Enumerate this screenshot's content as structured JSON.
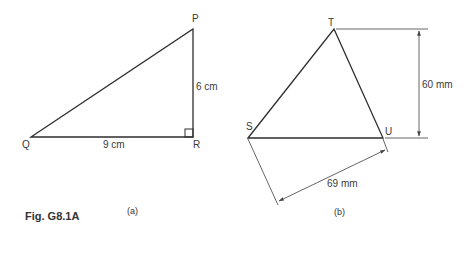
{
  "figure": {
    "caption": "Fig. G8.1A",
    "colors": {
      "line": "#333333",
      "dimension": "#555555",
      "background": "#ffffff"
    }
  },
  "diagram_a": {
    "sublabel": "(a)",
    "vertices": {
      "P": {
        "label": "P",
        "x": 193,
        "y": 29
      },
      "Q": {
        "label": "Q",
        "x": 31,
        "y": 137
      },
      "R": {
        "label": "R",
        "x": 193,
        "y": 137
      }
    },
    "right_angle_at": "R",
    "sides": {
      "QR": {
        "label": "9 cm"
      },
      "PR": {
        "label": "6 cm"
      }
    }
  },
  "diagram_b": {
    "sublabel": "(b)",
    "vertices": {
      "T": {
        "label": "T",
        "x": 334,
        "y": 29
      },
      "S": {
        "label": "S",
        "x": 248,
        "y": 138
      },
      "U": {
        "label": "U",
        "x": 383,
        "y": 138
      }
    },
    "dimensions": {
      "height": {
        "label": "60 mm"
      },
      "SU_offset": {
        "label": "69 mm"
      }
    }
  }
}
